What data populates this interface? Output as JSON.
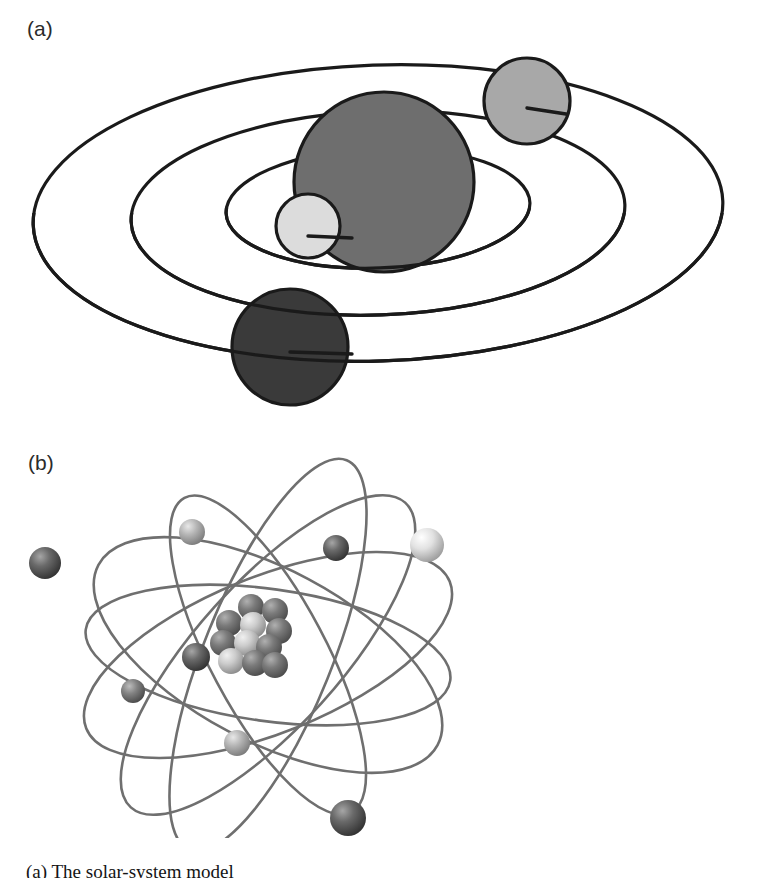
{
  "figure": {
    "type": "scientific-illustration",
    "background_color": "#ffffff",
    "width": 757,
    "height": 878,
    "caption_partial": "(a) The solar-system model"
  },
  "panels": [
    {
      "id": "a",
      "label": "(a)",
      "title": "solar-system / Bohr planetary atom model",
      "style": "flat two-tone line art",
      "stroke_color": "#1a1a1a",
      "stroke_width": 3.2,
      "orbits": [
        {
          "name": "outer-orbit",
          "cx": 378,
          "cy": 213,
          "rx": 345,
          "ry": 148,
          "rotate": -2
        },
        {
          "name": "middle-orbit",
          "cx": 378,
          "cy": 213,
          "rx": 247,
          "ry": 102,
          "rotate": -2
        },
        {
          "name": "inner-orbit",
          "cx": 378,
          "cy": 208,
          "rx": 152,
          "ry": 60,
          "rotate": -2
        }
      ],
      "bodies": [
        {
          "name": "nucleus",
          "cx": 384,
          "cy": 182,
          "r": 90,
          "fill": "#6e6e6e"
        },
        {
          "name": "electron-light",
          "cx": 308,
          "cy": 226,
          "r": 32,
          "fill": "#dcdcdc"
        },
        {
          "name": "electron-mid-gray",
          "cx": 527,
          "cy": 101,
          "r": 43,
          "fill": "#a8a8a8"
        },
        {
          "name": "electron-dark",
          "cx": 290,
          "cy": 347,
          "r": 58,
          "fill": "#3a3a3a"
        }
      ]
    },
    {
      "id": "b",
      "label": "(b)",
      "title": "three-dimensional rendered atom with nucleus and orbiting electrons",
      "style": "shaded 3D render, grey pencil orbit paths",
      "orbit_stroke_color": "#6f6f6f",
      "orbit_stroke_width": 2.6,
      "orbits": [
        {
          "name": "orbit-1",
          "cx": 268,
          "cy": 655,
          "rx": 196,
          "ry": 78,
          "rotate": -22
        },
        {
          "name": "orbit-2",
          "cx": 268,
          "cy": 655,
          "rx": 192,
          "ry": 86,
          "rotate": 28
        },
        {
          "name": "orbit-3",
          "cx": 268,
          "cy": 655,
          "rx": 184,
          "ry": 66,
          "rotate": 8
        },
        {
          "name": "orbit-4",
          "cx": 268,
          "cy": 655,
          "rx": 205,
          "ry": 72,
          "rotate": -48
        },
        {
          "name": "orbit-5",
          "cx": 268,
          "cy": 655,
          "rx": 178,
          "ry": 58,
          "rotate": 62
        },
        {
          "name": "orbit-6",
          "cx": 268,
          "cy": 655,
          "rx": 210,
          "ry": 64,
          "rotate": -68
        }
      ],
      "electrons": [
        {
          "name": "electron-upper-left-dark",
          "cx": 45,
          "cy": 563,
          "r": 16,
          "tone": "dark",
          "fill": "#545454"
        },
        {
          "name": "electron-top-light",
          "cx": 192,
          "cy": 532,
          "r": 13,
          "tone": "light",
          "fill": "#b8b8b8"
        },
        {
          "name": "electron-upper-mid-dark",
          "cx": 336,
          "cy": 548,
          "r": 13,
          "tone": "dark",
          "fill": "#5e5e5e"
        },
        {
          "name": "electron-right-bright",
          "cx": 427,
          "cy": 545,
          "r": 17,
          "tone": "bright",
          "fill": "#dedede"
        },
        {
          "name": "electron-inner-dark",
          "cx": 196,
          "cy": 657,
          "r": 14,
          "tone": "dark",
          "fill": "#4a4a4a"
        },
        {
          "name": "electron-left-mid",
          "cx": 133,
          "cy": 691,
          "r": 12,
          "tone": "mid",
          "fill": "#707070"
        },
        {
          "name": "electron-lower-mid-light",
          "cx": 237,
          "cy": 743,
          "r": 13,
          "tone": "light",
          "fill": "#a9a9a9"
        },
        {
          "name": "electron-bottom-dark",
          "cx": 348,
          "cy": 818,
          "r": 18,
          "tone": "dark",
          "fill": "#575757"
        }
      ],
      "nucleus": {
        "name": "nucleon-cluster",
        "center_x": 253,
        "center_y": 635,
        "nucleon_radius": 13,
        "proton_color": "#6b6b6b",
        "neutron_color": "#c9c9c9",
        "nucleons": [
          {
            "dx": -2,
            "dy": -28,
            "r": 13,
            "kind": "proton"
          },
          {
            "dx": 22,
            "dy": -24,
            "r": 13,
            "kind": "proton"
          },
          {
            "dx": -24,
            "dy": -12,
            "r": 13,
            "kind": "proton"
          },
          {
            "dx": 0,
            "dy": -10,
            "r": 13,
            "kind": "neutron"
          },
          {
            "dx": 26,
            "dy": -4,
            "r": 13,
            "kind": "proton"
          },
          {
            "dx": -30,
            "dy": 8,
            "r": 13,
            "kind": "proton"
          },
          {
            "dx": -6,
            "dy": 8,
            "r": 13,
            "kind": "neutron"
          },
          {
            "dx": 16,
            "dy": 12,
            "r": 13,
            "kind": "proton"
          },
          {
            "dx": -22,
            "dy": 26,
            "r": 13,
            "kind": "neutron"
          },
          {
            "dx": 2,
            "dy": 28,
            "r": 13,
            "kind": "proton"
          },
          {
            "dx": 22,
            "dy": 30,
            "r": 13,
            "kind": "proton"
          },
          {
            "dx": -2,
            "dy": -2,
            "r": 13,
            "kind": "neutron"
          }
        ]
      }
    }
  ]
}
